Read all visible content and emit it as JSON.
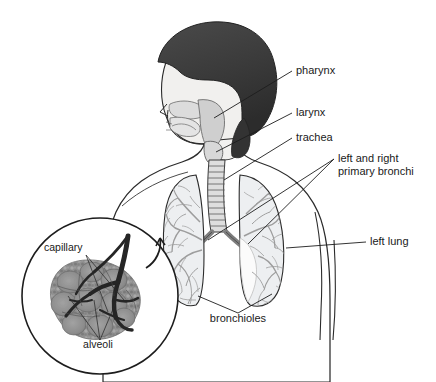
{
  "figure": {
    "background_color": "#ffffff",
    "width": 436,
    "height": 382
  },
  "colors": {
    "hair": "#3b3b3b",
    "hair_shadow": "#2a2a2a",
    "skin": "#f1f0ee",
    "body_fill": "#f0efed",
    "lung_fill": "#eceef0",
    "bronchial_tree": "#9a9a9a",
    "trachea_fill": "#dcdcdc",
    "pharynx_fill": "#d2d2d2",
    "outline": "#2b2b2b",
    "label_text": "#1a1a1a",
    "alveoli_tissue": "#8d8d8d",
    "vessel_dark": "#262626",
    "inset_circle_stroke": "#1d1d1d"
  },
  "labels": [
    {
      "id": "pharynx",
      "text": "pharynx",
      "x": 296,
      "y": 74,
      "anchor": "start"
    },
    {
      "id": "larynx",
      "text": "larynx",
      "x": 296,
      "y": 116,
      "anchor": "start"
    },
    {
      "id": "trachea",
      "text": "trachea",
      "x": 296,
      "y": 141,
      "anchor": "start"
    },
    {
      "id": "primary-bronchi-line-1",
      "text": "left and right",
      "x": 338,
      "y": 162,
      "anchor": "start"
    },
    {
      "id": "primary-bronchi-line-2",
      "text": "primary bronchi",
      "x": 338,
      "y": 175,
      "anchor": "start"
    },
    {
      "id": "left-lung",
      "text": "left lung",
      "x": 370,
      "y": 245,
      "anchor": "start"
    },
    {
      "id": "bronchioles",
      "text": "bronchioles",
      "x": 238,
      "y": 322,
      "anchor": "middle"
    },
    {
      "id": "capillary",
      "text": "capillary",
      "x": 44,
      "y": 251,
      "anchor": "start"
    },
    {
      "id": "alveoli",
      "text": "alveoli",
      "x": 98,
      "y": 348,
      "anchor": "middle"
    }
  ],
  "parts": {
    "head": "dark-hair-profile-head",
    "torso": "upper-body-silhouette",
    "airway": "pharynx-larynx-trachea",
    "lungs": "left-and-right-lungs-with-bronchial-trees",
    "inset": "alveoli-capillary-magnification-circle"
  }
}
